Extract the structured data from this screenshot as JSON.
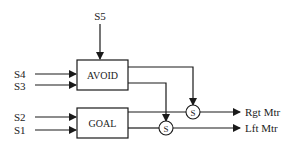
{
  "diagram": {
    "type": "block-diagram",
    "colors": {
      "stroke": "#1a1a1a",
      "background": "#ffffff",
      "text": "#222222"
    },
    "inputs": {
      "s5": "S5",
      "s4": "S4",
      "s3": "S3",
      "s2": "S2",
      "s1": "S1"
    },
    "blocks": {
      "avoid": "AVOID",
      "goal": "GOAL"
    },
    "summers": {
      "right": "S",
      "left": "S"
    },
    "outputs": {
      "right_motor": "Rgt Mtr",
      "left_motor": "Lft Mtr"
    }
  }
}
